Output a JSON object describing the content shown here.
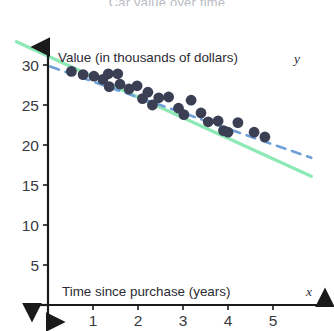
{
  "title": "Car value over time",
  "axes": {
    "x_label": "Time since purchase (years)",
    "x_var": "x",
    "y_label": "Value (in thousands of dollars)",
    "y_var": "y"
  },
  "colors": {
    "point": "#3b3f54",
    "axis": "#1a1a1a",
    "green_line": "#8de9b6",
    "blue_dashed_line": "#6f9fd8",
    "tick_text": "#3a3a42",
    "title_text": "#b9bcc4"
  },
  "chart_data": {
    "type": "scatter",
    "title": "Car value over time",
    "xlabel": "Time since purchase (years)",
    "ylabel": "Value (in thousands of dollars)",
    "xlim": [
      0,
      5.8
    ],
    "ylim": [
      0,
      32
    ],
    "xticks": [
      1,
      2,
      3,
      4,
      5
    ],
    "yticks": [
      5,
      10,
      15,
      20,
      25,
      30
    ],
    "grid": false,
    "legend": "none",
    "points": [
      {
        "x": 0.52,
        "y": 29.2
      },
      {
        "x": 0.78,
        "y": 28.8
      },
      {
        "x": 1.02,
        "y": 28.6
      },
      {
        "x": 1.22,
        "y": 28.2
      },
      {
        "x": 1.34,
        "y": 28.9
      },
      {
        "x": 1.36,
        "y": 27.3
      },
      {
        "x": 1.55,
        "y": 28.9
      },
      {
        "x": 1.6,
        "y": 27.6
      },
      {
        "x": 1.8,
        "y": 27.0
      },
      {
        "x": 1.98,
        "y": 27.4
      },
      {
        "x": 2.1,
        "y": 25.8
      },
      {
        "x": 2.22,
        "y": 26.6
      },
      {
        "x": 2.32,
        "y": 25.0
      },
      {
        "x": 2.46,
        "y": 25.9
      },
      {
        "x": 2.68,
        "y": 26.0
      },
      {
        "x": 2.9,
        "y": 24.6
      },
      {
        "x": 3.02,
        "y": 23.8
      },
      {
        "x": 3.18,
        "y": 25.6
      },
      {
        "x": 3.4,
        "y": 24.0
      },
      {
        "x": 3.56,
        "y": 22.9
      },
      {
        "x": 3.78,
        "y": 23.0
      },
      {
        "x": 3.9,
        "y": 21.8
      },
      {
        "x": 4.0,
        "y": 21.6
      },
      {
        "x": 4.22,
        "y": 22.8
      },
      {
        "x": 4.58,
        "y": 21.6
      },
      {
        "x": 4.82,
        "y": 21.0
      }
    ],
    "lines": [
      {
        "name": "green-solid-line",
        "style": "solid",
        "color": "#8de9b6",
        "x0": -0.7,
        "y0": 32.9,
        "x1": 5.85,
        "y1": 16.1
      },
      {
        "name": "blue-dashed-line",
        "style": "dashed",
        "color": "#6f9fd8",
        "x0": 0.05,
        "y0": 29.8,
        "x1": 5.85,
        "y1": 18.4
      }
    ]
  }
}
